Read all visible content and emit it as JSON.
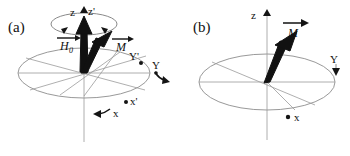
{
  "figure": {
    "type": "scientific-diagram",
    "background_color": "#ffffff",
    "ink_color": "#111111",
    "guide_color": "#8d8d8d",
    "panels": [
      {
        "id": "a",
        "tag": "(a)",
        "axes": [
          {
            "name": "z-axis-label",
            "label": "z"
          },
          {
            "name": "z-prime-axis-label",
            "label": "z'"
          },
          {
            "name": "y-axis-label",
            "label": "Y"
          },
          {
            "name": "y-prime-axis-label",
            "label": "Y'"
          },
          {
            "name": "x-axis-label",
            "label": "x"
          },
          {
            "name": "x-prime-axis-label",
            "label": "x'"
          }
        ],
        "vectors": [
          {
            "name": "h0-vector",
            "symbol": "H",
            "subscript": "0",
            "overline": "vector-arrow"
          },
          {
            "name": "m-vector",
            "symbol": "M",
            "subscript": "",
            "overline": "vector-arrow"
          }
        ],
        "annotations": [
          {
            "name": "precession-ellipse",
            "label": ""
          },
          {
            "name": "frame-rotation-arrow",
            "label": ""
          }
        ]
      },
      {
        "id": "b",
        "tag": "(b)",
        "axes": [
          {
            "name": "z-axis-label",
            "label": "z"
          },
          {
            "name": "y-axis-label",
            "label": "Y"
          },
          {
            "name": "x-axis-label",
            "label": "x"
          }
        ],
        "vectors": [
          {
            "name": "m-vector",
            "symbol": "M",
            "subscript": "",
            "overline": "vector-arrow"
          }
        ],
        "annotations": []
      }
    ]
  }
}
